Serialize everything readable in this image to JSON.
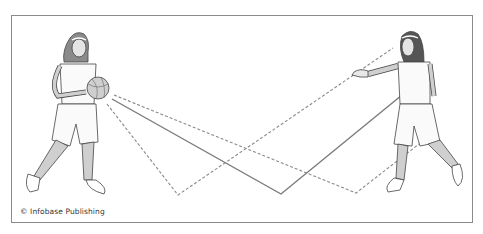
{
  "figure": {
    "credit": "© Infobase Publishing",
    "players": [
      {
        "name": "passer",
        "position": "left",
        "holding": "basketball"
      },
      {
        "name": "receiver",
        "position": "right",
        "pose": "arm extended to receive"
      }
    ],
    "paths": [
      {
        "id": "solid-bounce-pass",
        "style": "solid",
        "color": "#7a7a7a",
        "points": [
          [
            112,
            99
          ],
          [
            281,
            194
          ],
          [
            402,
            95
          ]
        ]
      },
      {
        "id": "dashed-low-bounce-pass",
        "style": "dashed",
        "color": "#8a8a8a",
        "points": [
          [
            107,
            104
          ],
          [
            178,
            195
          ],
          [
            393,
            48
          ]
        ]
      },
      {
        "id": "dashed-high-bounce-pass",
        "style": "dashed",
        "color": "#8a8a8a",
        "points": [
          [
            114,
            95
          ],
          [
            356,
            193
          ],
          [
            419,
            144
          ]
        ]
      }
    ],
    "colors": {
      "line": "#7a7a7a",
      "frame": "#8a8a8a",
      "skin": "#c8c8c8",
      "hair": "#6a6a6a",
      "outline": "#444444"
    }
  }
}
